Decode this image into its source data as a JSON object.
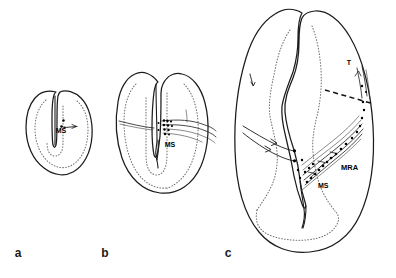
{
  "figure": {
    "kind": "scientific-line-drawing",
    "background_color": "#ffffff",
    "ink_color": "#1c1c1c",
    "dotted_color": "#6e6e6e",
    "panels": [
      {
        "id": "a",
        "letter": "a",
        "letter_x": 18,
        "letter_y": 257,
        "caption": "",
        "labels": [
          {
            "text": "MS",
            "x": 61,
            "y": 133,
            "class": "lbl-ms"
          }
        ]
      },
      {
        "id": "b",
        "letter": "b",
        "letter_x": 105,
        "letter_y": 257,
        "caption": "",
        "labels": [
          {
            "text": "MS",
            "x": 170,
            "y": 147,
            "class": "lbl-ms"
          }
        ]
      },
      {
        "id": "c",
        "letter": "c",
        "letter_x": 228,
        "letter_y": 257,
        "caption": "",
        "labels": [
          {
            "text": "T",
            "x": 349,
            "y": 65,
            "class": "lbl-t"
          },
          {
            "text": "MRA",
            "x": 341,
            "y": 170,
            "class": "lbl-mra"
          },
          {
            "text": "MS",
            "x": 318,
            "y": 188,
            "class": "lbl-ms"
          }
        ]
      }
    ],
    "legend_keys": [
      {
        "abbrev": "MS",
        "meaning": "MS"
      },
      {
        "abbrev": "MRA",
        "meaning": "MRA"
      },
      {
        "abbrev": "T",
        "meaning": "T"
      }
    ]
  }
}
